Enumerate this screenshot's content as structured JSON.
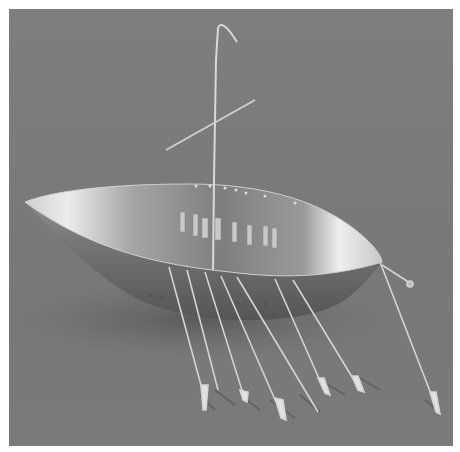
{
  "image": {
    "subject": "Gold model boat with oars, mast and yard",
    "alt": "Photograph of a golden boat model with seven oars on each visible side, a mast with crossed yard, and a steering oar, on a grey background",
    "background_color": "#7b7b7b",
    "border_color": "#ffffff",
    "boat_highlight_color": "#e6e6e6",
    "boat_shadow_color": "#4a4a4a"
  },
  "boat": {
    "oar_count": 8,
    "has_mast": true,
    "has_yard": true,
    "has_steering_oar": true
  }
}
